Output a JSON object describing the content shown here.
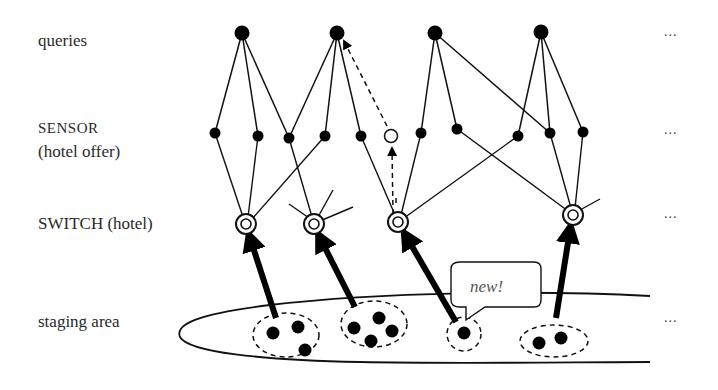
{
  "labels": {
    "queries": "queries",
    "sensor_line1": "SENSOR",
    "sensor_line2": "(hotel offer)",
    "switch": "SWITCH (hotel)",
    "staging": "staging area"
  },
  "ellipsis": {
    "queries": "...",
    "sensor": "...",
    "switch": "...",
    "staging": "..."
  },
  "callout": {
    "text": "new!"
  },
  "colors": {
    "line": "#111111",
    "node_fill": "#000000",
    "background": "#ffffff",
    "text": "#2a2a2a"
  },
  "nodes": {
    "queries": [
      {
        "id": "q1",
        "x": 242,
        "y": 33
      },
      {
        "id": "q2",
        "x": 337,
        "y": 33
      },
      {
        "id": "q3",
        "x": 435,
        "y": 33
      },
      {
        "id": "q4",
        "x": 541,
        "y": 32
      }
    ],
    "sensors": [
      {
        "id": "s1",
        "x": 215,
        "y": 133
      },
      {
        "id": "s2",
        "x": 258,
        "y": 136
      },
      {
        "id": "s3",
        "x": 289,
        "y": 138
      },
      {
        "id": "s4",
        "x": 325,
        "y": 136
      },
      {
        "id": "s5",
        "x": 361,
        "y": 136
      },
      {
        "id": "s6",
        "x": 391,
        "y": 136,
        "hollow": true
      },
      {
        "id": "s7",
        "x": 421,
        "y": 133
      },
      {
        "id": "s8",
        "x": 457,
        "y": 129
      },
      {
        "id": "s9",
        "x": 518,
        "y": 136
      },
      {
        "id": "s10",
        "x": 550,
        "y": 133
      },
      {
        "id": "s11",
        "x": 583,
        "y": 132
      }
    ],
    "switches": [
      {
        "id": "w1",
        "x": 246,
        "y": 224
      },
      {
        "id": "w2",
        "x": 314,
        "y": 224
      },
      {
        "id": "w3",
        "x": 398,
        "y": 222
      },
      {
        "id": "w4",
        "x": 573,
        "y": 215
      }
    ]
  },
  "staging_groups": [
    {
      "id": "g1",
      "items": 3
    },
    {
      "id": "g2",
      "items": 4
    },
    {
      "id": "g3",
      "items": 1,
      "new": true
    },
    {
      "id": "g4",
      "items": 2
    }
  ]
}
